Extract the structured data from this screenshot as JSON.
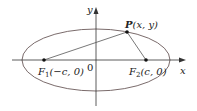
{
  "diagram": {
    "axes": {
      "x_label": "x",
      "y_label": "y",
      "origin_label": "0"
    },
    "ellipse": {
      "cx": 96,
      "cy": 60,
      "rx": 74,
      "ry": 31
    },
    "points": {
      "P": {
        "label_main": "P",
        "label_coords": "(x, y)",
        "px": 127,
        "py": 32
      },
      "F1": {
        "label_main": "F",
        "label_sub": "1",
        "label_coords": "(−c, 0)",
        "px": 44,
        "py": 60
      },
      "F2": {
        "label_main": "F",
        "label_sub": "2",
        "label_coords": "(c, 0)",
        "px": 146,
        "py": 60
      }
    },
    "colors": {
      "ellipse": "#6b5a5a",
      "axes": "#333333",
      "segments": "#555555",
      "points": "#111111"
    }
  }
}
